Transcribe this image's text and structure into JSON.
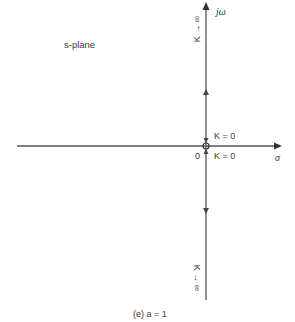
{
  "diagram": {
    "type": "root-locus",
    "plane_label": "s-plane",
    "axes": {
      "real_axis_label": "σ",
      "imag_axis_label": "jω",
      "origin_label": "0"
    },
    "annotations": {
      "top": "K → ∞",
      "bottom": "K → ∞",
      "k_zero_upper": "K = 0",
      "k_zero_lower": "K = 0"
    },
    "caption": "(e)  a = 1",
    "colors": {
      "axis": "#555555",
      "text": "#3a3a3a"
    }
  }
}
